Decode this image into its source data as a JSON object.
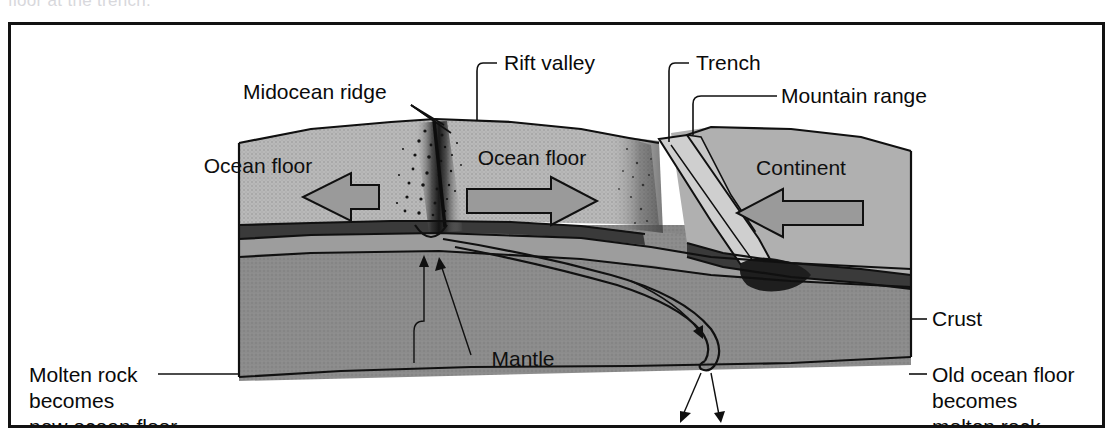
{
  "figure": {
    "cutoff_top_text": "floor at the trench.",
    "frame": {
      "border_color": "#121212",
      "background": "#ffffff"
    }
  },
  "palette": {
    "ocean_floor_top": "#b9b9b9",
    "ocean_floor_side": "#a3a3a3",
    "continent_top": "#b0b0b0",
    "mantle": "#8c8c8c",
    "mantle_deep": "#848484",
    "lower_crust_dark": "#3a3a3a",
    "slab_light": "#cfcfcf",
    "magma_black": "#1a1a1a",
    "arrow_fill": "#9a9a9a",
    "outline": "#101010",
    "label_text": "#0a0a0a"
  },
  "callouts": [
    {
      "id": "midocean-ridge",
      "label": "Midocean ridge",
      "x": 232,
      "y": 74,
      "anchor": "start"
    },
    {
      "id": "rift-valley",
      "label": "Rift valley",
      "x": 489,
      "y": 45,
      "anchor": "start"
    },
    {
      "id": "trench",
      "label": "Trench",
      "x": 681,
      "y": 45,
      "anchor": "start"
    },
    {
      "id": "mountain-range",
      "label": "Mountain range",
      "x": 770,
      "y": 78,
      "anchor": "start"
    },
    {
      "id": "crust",
      "label": "Crust",
      "x": 921,
      "y": 300,
      "anchor": "start"
    },
    {
      "id": "old-ocean-floor",
      "label": "Old ocean floor",
      "x": 921,
      "y": 355,
      "anchor": "start"
    },
    {
      "id": "molten-rock",
      "label": "Molten rock",
      "x": 18,
      "y": 355,
      "anchor": "start"
    }
  ],
  "multiline_captions": {
    "molten_rock": {
      "id": "molten-rock-caption",
      "lines": [
        "Molten rock",
        "becomes",
        "new ocean floor"
      ],
      "x": 18,
      "y": 355
    },
    "old_ocean_floor": {
      "id": "old-ocean-floor-caption",
      "lines": [
        "Old ocean floor",
        "becomes",
        "molten rock"
      ],
      "x": 921,
      "y": 355
    }
  },
  "interior_labels": [
    {
      "id": "ocean-floor-left",
      "label": "Ocean floor",
      "x": 204,
      "y": 148
    },
    {
      "id": "ocean-floor-right",
      "label": "Ocean floor",
      "x": 478,
      "y": 140
    },
    {
      "id": "continent",
      "label": "Continent",
      "x": 784,
      "y": 150
    },
    {
      "id": "mantle",
      "label": "Mantle",
      "x": 512,
      "y": 341
    }
  ],
  "motion_arrows": [
    {
      "id": "arrow-ocean-floor-left",
      "direction": "left",
      "meaning": "ocean floor spreading west"
    },
    {
      "id": "arrow-ocean-floor-right",
      "direction": "right",
      "meaning": "ocean floor spreading east"
    },
    {
      "id": "arrow-continent",
      "direction": "left",
      "meaning": "continent moving west"
    }
  ],
  "flow_arrows": [
    {
      "id": "magma-upwelling-arrow-1",
      "direction": "up",
      "meaning": "molten rock rising at ridge"
    },
    {
      "id": "magma-upwelling-arrow-2",
      "direction": "up",
      "meaning": "molten rock rising at ridge"
    },
    {
      "id": "subducting-slab-arrow",
      "direction": "down",
      "meaning": "old ocean floor descending"
    },
    {
      "id": "downwelling-arrow-1",
      "direction": "down",
      "meaning": "mantle downwelling"
    },
    {
      "id": "downwelling-arrow-2",
      "direction": "down",
      "meaning": "mantle downwelling"
    }
  ]
}
